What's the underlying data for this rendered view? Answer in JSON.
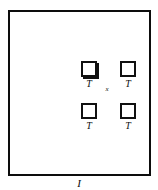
{
  "figure": {
    "outer_region": {
      "label": "I",
      "border_color": "#0d0d0d"
    },
    "center_point": {
      "label": "x"
    },
    "cells": [
      {
        "id": "top-left",
        "label": "T"
      },
      {
        "id": "top-right",
        "label": "T"
      },
      {
        "id": "bottom-left",
        "label": "T"
      },
      {
        "id": "bottom-right",
        "label": "T"
      }
    ],
    "colors": {
      "background": "#ffffff",
      "stroke": "#0d0d0d"
    }
  }
}
